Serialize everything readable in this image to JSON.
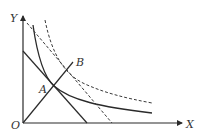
{
  "diagram": {
    "labels": {
      "y_axis": "Y",
      "x_axis": "X",
      "origin": "O",
      "point_a": "A",
      "point_b": "B"
    },
    "colors": {
      "line": "#2a2a2a",
      "dashed": "#3a3a3a",
      "background": "#ffffff"
    },
    "elements": [
      {
        "name": "y-axis",
        "type": "arrow",
        "style": "solid"
      },
      {
        "name": "x-axis",
        "type": "arrow",
        "style": "solid"
      },
      {
        "name": "budget-line-1",
        "type": "line",
        "style": "solid"
      },
      {
        "name": "income-expansion-line",
        "type": "line",
        "style": "solid",
        "through": [
          "O",
          "A",
          "B"
        ]
      },
      {
        "name": "indifference-curve-1",
        "type": "curve",
        "style": "solid",
        "tangent_at": "A"
      },
      {
        "name": "budget-line-2",
        "type": "line",
        "style": "dashed"
      },
      {
        "name": "indifference-curve-2",
        "type": "curve",
        "style": "dashed"
      }
    ]
  }
}
